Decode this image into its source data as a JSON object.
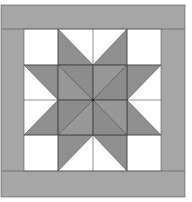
{
  "quilt": {
    "title": "",
    "colors": {
      "background": "#ffffff",
      "border": "#a6a6a6",
      "star": "#8f8f8f",
      "star_alt": "#999999",
      "white": "#ffffff",
      "line": "#555555"
    },
    "frame": {
      "x": 1,
      "y": 5,
      "w": 184,
      "h": 192
    },
    "inner": {
      "x": 24,
      "y": 29,
      "w": 137,
      "h": 142
    },
    "grid": {
      "rows": 4,
      "cols": 4
    }
  }
}
